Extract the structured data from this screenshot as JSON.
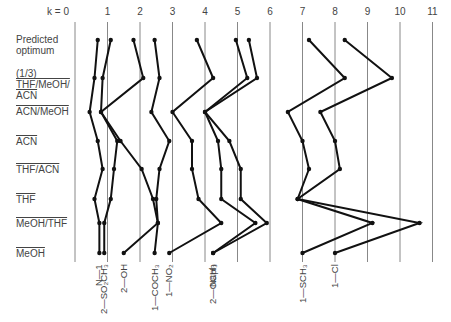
{
  "chart_data": {
    "type": "line",
    "title": "",
    "xlabel": "k",
    "ylabel": "",
    "x_axis_prefix": "k = ",
    "xlim": [
      0,
      11
    ],
    "x_ticks": [
      0,
      1,
      2,
      3,
      4,
      5,
      6,
      7,
      8,
      9,
      10,
      11
    ],
    "grid": "vertical",
    "rows": [
      "Predicted optimum",
      "(1/3) THF/MeOH/ACN",
      "ACN/MeOH",
      "ACN",
      "THF/ACN",
      "THF",
      "MeOH/THF",
      "MeOH"
    ],
    "series": [
      {
        "name": "N—1",
        "values": [
          0.7,
          0.6,
          0.45,
          0.7,
          0.85,
          0.6,
          0.75,
          0.75
        ]
      },
      {
        "name": "2—SO2CH3",
        "values": [
          1.1,
          0.85,
          0.8,
          1.3,
          1.2,
          1.1,
          0.9,
          0.9
        ]
      },
      {
        "name": "2—OH",
        "values": [
          1.8,
          2.1,
          0.8,
          1.4,
          2.05,
          2.4,
          2.55,
          1.5
        ]
      },
      {
        "name": "1—COCH3",
        "values": [
          2.45,
          2.6,
          2.35,
          2.9,
          2.6,
          2.5,
          2.55,
          2.45
        ]
      },
      {
        "name": "1—NO2",
        "values": [
          3.75,
          4.25,
          3.0,
          3.6,
          3.6,
          3.8,
          4.5,
          2.9
        ]
      },
      {
        "name": "2—OCH3",
        "values": [
          4.95,
          5.3,
          4.0,
          4.4,
          4.5,
          4.5,
          5.55,
          4.25
        ]
      },
      {
        "name": "Naph",
        "values": [
          5.35,
          5.6,
          4.0,
          4.75,
          5.1,
          5.1,
          5.9,
          4.25
        ]
      },
      {
        "name": "1—SCH3",
        "values": [
          7.2,
          8.3,
          6.55,
          7.0,
          7.2,
          6.85,
          9.15,
          7.0
        ]
      },
      {
        "name": "1—Cl",
        "values": [
          8.3,
          9.75,
          7.55,
          8.0,
          8.15,
          6.85,
          10.6,
          8.0
        ]
      }
    ]
  },
  "axis": {
    "k_label": "k = 0"
  },
  "ticks": [
    "1",
    "2",
    "3",
    "4",
    "5",
    "6",
    "7",
    "8",
    "9",
    "10",
    "11"
  ],
  "row_labels": {
    "predicted_1": "Predicted",
    "predicted_2": "optimum",
    "third_1": "(1/3)",
    "third_2": "THF/MeOH/",
    "third_3": "ACN",
    "acn_meoh": "ACN/MeOH",
    "acn": "ACN",
    "thf_acn": "THF/ACN",
    "thf": "THF",
    "meoh_thf": "MeOH/THF",
    "meoh": "MeOH"
  },
  "substituents": [
    "N—1",
    "2—SO₂CH₃",
    "2—OH",
    "1—COCH₃",
    "1—NO₂",
    "2—OCH₃",
    "Naph",
    "1—SCH₃",
    "1—Cl"
  ]
}
